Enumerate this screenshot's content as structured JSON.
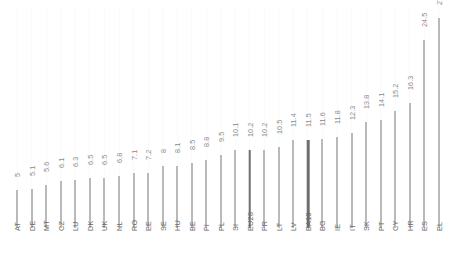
{
  "chart_data": {
    "type": "bar",
    "title": "",
    "subtitle": "",
    "xlabel": "",
    "ylabel": "",
    "grid": true,
    "legend": "none",
    "ylim": [
      0,
      27.3
    ],
    "orientation": "vertical",
    "categories": [
      "AT",
      "DE",
      "MT",
      "CZ",
      "LU",
      "DK",
      "UK",
      "NL",
      "RO",
      "EE",
      "SE",
      "HU",
      "BE",
      "FI",
      "PL",
      "SI",
      "EU28",
      "FR",
      "LT",
      "LV",
      "EA18",
      "BG",
      "IE",
      "IT",
      "SK",
      "PT",
      "CY",
      "HR",
      "ES",
      "EL"
    ],
    "values": [
      5,
      5.1,
      5.6,
      6.1,
      6.3,
      6.5,
      6.5,
      6.8,
      7.1,
      7.2,
      8,
      8.1,
      8.5,
      8.8,
      9.5,
      10.1,
      10.2,
      10.2,
      10.5,
      11.4,
      11.5,
      11.6,
      11.8,
      12.3,
      13.8,
      14.1,
      15.2,
      16.3,
      24.5,
      27.3
    ],
    "value_labels": [
      "5",
      "5.1",
      "5.6",
      "6.1",
      "6.3",
      "6.5",
      "6.5",
      "6.8",
      "7.1",
      "7.2",
      "8",
      "8.1",
      "8.5",
      "8.8",
      "9.5",
      "10.1",
      "10.2",
      "10.2",
      "10.5",
      "11.4",
      "11.5",
      "11.6",
      "11.8",
      "12.3",
      "13.8",
      "14.1",
      "15.2",
      "16.3",
      "24.5",
      "27.3"
    ],
    "highlighted": [
      "EU28",
      "EA18"
    ],
    "colors": {
      "bar": "#b9b9b9",
      "bar_highlight": "#6e6e6e",
      "value_label": "#8a8a8a",
      "category_label": "#6b6b6b",
      "gridline": "#fafafa",
      "background": "#ffffff"
    }
  }
}
